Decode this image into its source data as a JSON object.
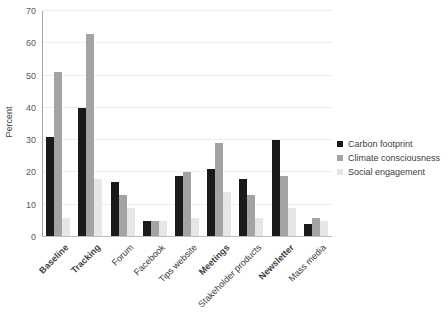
{
  "chart_data": {
    "type": "bar",
    "title": "",
    "xlabel": "",
    "ylabel": "Percent",
    "ylim": [
      0,
      70
    ],
    "yticks": [
      0,
      10,
      20,
      30,
      40,
      50,
      60,
      70
    ],
    "grid": true,
    "legend_position": "right",
    "categories": [
      "Baseline",
      "Tracking",
      "Forum",
      "Facebook",
      "Tips website",
      "Meetings",
      "Stakeholder products",
      "Newsletter",
      "Mass media"
    ],
    "bold_categories": [
      "Baseline",
      "Tracking",
      "Meetings",
      "Newsletter"
    ],
    "series": [
      {
        "name": "Carbon footprint",
        "color": "#1a1a1a",
        "values": [
          31,
          40,
          17,
          5,
          19,
          21,
          18,
          30,
          4
        ]
      },
      {
        "name": "Climate consciousness",
        "color": "#a3a3a3",
        "values": [
          51,
          63,
          13,
          5,
          20,
          29,
          13,
          19,
          6
        ]
      },
      {
        "name": "Social engagement",
        "color": "#e6e6e6",
        "values": [
          6,
          18,
          9,
          5,
          6,
          14,
          6,
          9,
          5
        ]
      }
    ]
  },
  "colors": {
    "background": "#ffffff",
    "y_axis_line": "#a6a6a6",
    "x_axis_line": "#bfbfbf",
    "gridline": "#ededed",
    "tick_text": "#595959",
    "label_text": "#404040"
  }
}
